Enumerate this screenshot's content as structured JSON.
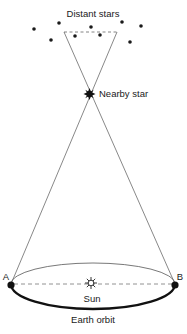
{
  "diagram": {
    "type": "stellar-parallax",
    "labels": {
      "distant_stars": "Distant stars",
      "nearby_star": "Nearby star",
      "sun": "Sun",
      "earth_orbit": "Earth orbit",
      "point_a": "A",
      "point_b": "B"
    },
    "colors": {
      "ink": "#1a1a1a",
      "line": "#555555",
      "dashed": "#666666",
      "background": "#ffffff"
    },
    "distant_star_count": 10
  }
}
